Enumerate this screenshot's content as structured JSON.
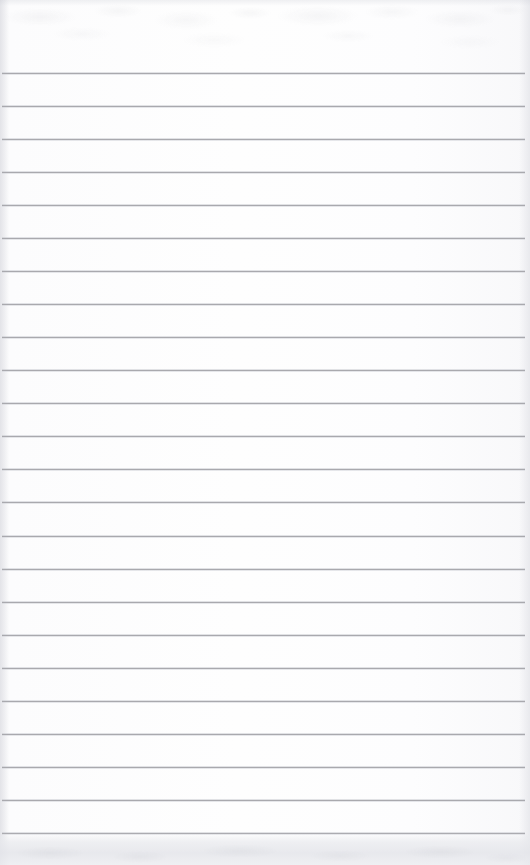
{
  "document": {
    "kind": "scanned-ruled-notebook-page",
    "page_label": "",
    "text_content": "",
    "has_visible_text": false
  },
  "page": {
    "width": 530,
    "height": 865,
    "paper_color": "#fdfdfe",
    "background_color": "#ffffff"
  },
  "ruling": {
    "line_color": "#a9a9ae",
    "line_thickness": 1,
    "line_count": 24,
    "line_start_x": 2,
    "line_end_x": 525,
    "first_line_y": 73,
    "last_line_y": 833,
    "line_spacing": 33.04,
    "line_y_positions": [
      73,
      106,
      139,
      172,
      205,
      238,
      271,
      304,
      337,
      370,
      403,
      436,
      469,
      502,
      536,
      569,
      602,
      635,
      668,
      701,
      734,
      767,
      800,
      833
    ]
  },
  "artifacts": {
    "top_bleed_band_height": 74,
    "bottom_shadow_band_height": 32,
    "edge_shading_color": "#c4c6ce",
    "bottom_shadow_color": "#e8e9ed"
  }
}
